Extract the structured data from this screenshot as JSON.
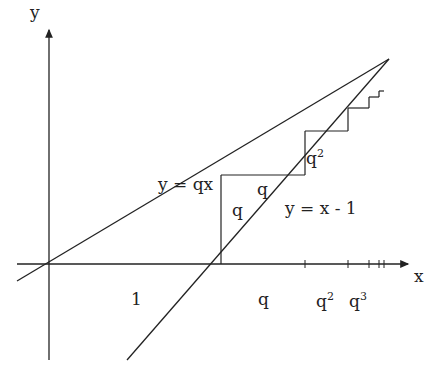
{
  "diagram": {
    "title": "",
    "axes": {
      "x_label": "x",
      "y_label": "y"
    },
    "lines": [
      {
        "id": "line-qx",
        "label": "y = qx"
      },
      {
        "id": "line-x-minus-1",
        "label": "y = x - 1"
      }
    ],
    "segment_labels": {
      "q_vertical": "q",
      "q_horizontal": "q",
      "q2_vertical_base": "q",
      "q2_vertical_exp": "2"
    },
    "x_axis_labels": {
      "one": "1",
      "q": "q",
      "q2_base": "q",
      "q2_exp": "2",
      "q3_base": "q",
      "q3_exp": "3"
    },
    "colors": {
      "stroke": "#222222",
      "background": "#ffffff"
    }
  }
}
